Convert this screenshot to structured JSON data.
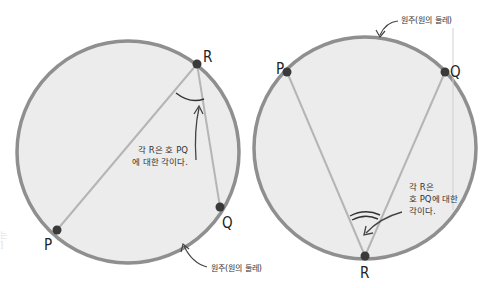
{
  "colors": {
    "circle_fill": "#ececec",
    "circle_stroke": "#8f8f8f",
    "chord": "#b5b5b5",
    "point": "#3a3a3a",
    "text": "#222222",
    "arrow": "#444444"
  },
  "left_diagram": {
    "points": {
      "P": "P",
      "Q": "Q",
      "R": "R"
    },
    "angle_note": {
      "line1": "각 R은 호 PQ",
      "line2": "에 대한 각이다."
    },
    "circumference_label": "원주(원의 둘레)"
  },
  "right_diagram": {
    "points": {
      "P": "P",
      "Q": "Q",
      "R": "R"
    },
    "angle_note": {
      "line1": "각 R은",
      "line2": "호 PQ에 대한",
      "line3": "각이다."
    },
    "circumference_label": "원주(원의 둘레)"
  },
  "cutoff_text": {
    "top": "",
    "left_line1": "는",
    "left_line2": "]"
  }
}
